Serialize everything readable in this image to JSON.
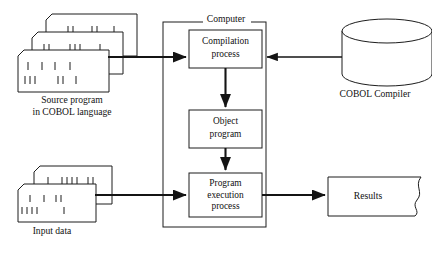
{
  "diagram": {
    "outer_group": {
      "label": "Computer"
    },
    "process_boxes": [
      {
        "id": "compilation",
        "label_line1": "Compilation",
        "label_line2": "process"
      },
      {
        "id": "object",
        "label_line1": "Object",
        "label_line2": "program"
      },
      {
        "id": "execution",
        "label_line1": "Program",
        "label_line2": "execution",
        "label_line3": "process"
      }
    ],
    "inputs": [
      {
        "id": "source-program",
        "shape": "punched-card-stack",
        "card_count": 3,
        "caption_line1": "Source program",
        "caption_line2": "in COBOL language"
      },
      {
        "id": "input-data",
        "shape": "punched-card-stack",
        "card_count": 2,
        "caption_line1": "Input data",
        "caption_line2": ""
      }
    ],
    "storage": {
      "id": "cobol-compiler",
      "shape": "cylinder",
      "caption": "COBOL  Compiler"
    },
    "output": {
      "id": "results",
      "shape": "document-flag",
      "label": "Results"
    },
    "colors": {
      "stroke": "#1d1d1d",
      "arrow": "#141414",
      "background": "#ffffff",
      "text": "#111111"
    }
  }
}
